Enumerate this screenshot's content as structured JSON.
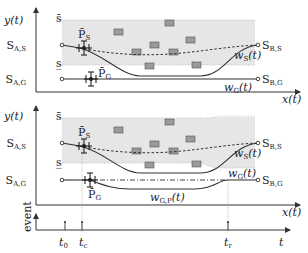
{
  "diagram": {
    "top_panel": {
      "y_axis_label": "y(t)",
      "x_axis_label": "x(t)",
      "upper_bound_label": "s̄",
      "lower_bound_label": "s̲",
      "start_sensor": "S",
      "start_sensor_sub": "A,S",
      "start_goal": "S",
      "start_goal_sub": "A,G",
      "end_sensor": "S",
      "end_sensor_sub": "B,S",
      "end_goal": "S",
      "end_goal_sub": "B,G",
      "p_s_label": "P̄",
      "p_s_sub": "S",
      "p_g_label": "P̄",
      "p_g_sub": "G",
      "w_s_label": "w",
      "w_s_sub": "S",
      "w_s_arg": "(t)",
      "w_g_label": "w",
      "w_g_sub": "G",
      "w_g_arg": "(t)"
    },
    "bottom_panel": {
      "y_axis_label": "y(t)",
      "x_axis_label": "x(t)",
      "upper_bound_label": "s̄",
      "lower_bound_label": "s̲",
      "start_sensor": "S",
      "start_sensor_sub": "A,S",
      "start_goal": "S",
      "start_goal_sub": "A,G",
      "end_sensor": "S",
      "end_sensor_sub": "B,S",
      "end_goal": "S",
      "end_goal_sub": "B,G",
      "p_s_label": "P̄",
      "p_s_sub": "S",
      "p_g_label": "P̄",
      "p_g_sub": "G",
      "w_s_label": "w",
      "w_s_sub": "S",
      "w_s_arg": "(t)",
      "w_g_label": "w",
      "w_g_sub": "G",
      "w_g_arg": "(t)",
      "w_gp_label": "w",
      "w_gp_sub": "G,P",
      "w_gp_arg": "(t)"
    },
    "event_axis": {
      "y_label": "event",
      "t_label": "t",
      "ticks": [
        {
          "label": "t",
          "sub": "0"
        },
        {
          "label": "t",
          "sub": "c"
        },
        {
          "label": "t",
          "sub": "r"
        }
      ]
    }
  }
}
